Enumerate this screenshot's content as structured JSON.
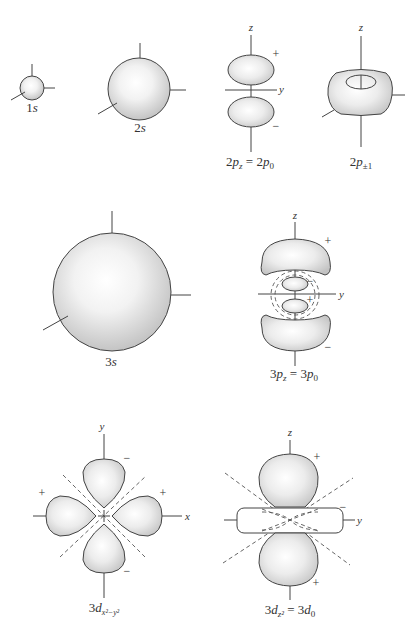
{
  "figure": {
    "colors": {
      "background": "#ffffff",
      "outline": "#444444",
      "fill_light": "#ffffff",
      "fill_dark": "#c8c8c8",
      "text": "#333333"
    },
    "orbitals": [
      {
        "id": "1s",
        "label_main": "1",
        "label_var": "s",
        "axes": []
      },
      {
        "id": "2s",
        "label_main": "2",
        "label_var": "s",
        "axes": []
      },
      {
        "id": "2pz",
        "label_prefix": "2",
        "label_var": "p",
        "label_sub": "z",
        "label_eq": " = 2",
        "label_var2": "p",
        "label_sub2": "0",
        "axes": [
          "z",
          "y"
        ],
        "signs": [
          "+",
          "−"
        ]
      },
      {
        "id": "2p±1",
        "label_prefix": "2",
        "label_var": "p",
        "label_sub": "±1",
        "axes": [
          "z"
        ]
      },
      {
        "id": "3s",
        "label_main": "3",
        "label_var": "s",
        "axes": []
      },
      {
        "id": "3pz",
        "label_prefix": "3",
        "label_var": "p",
        "label_sub": "z",
        "label_eq": " = 3",
        "label_var2": "p",
        "label_sub2": "0",
        "axes": [
          "z",
          "y"
        ],
        "signs": [
          "+",
          "−",
          "+",
          "−"
        ]
      },
      {
        "id": "3dx2-y2",
        "label_prefix": "3",
        "label_var": "d",
        "label_sub": "x²−y²",
        "axes": [
          "y",
          "x"
        ],
        "signs": [
          "−",
          "+",
          "+",
          "−"
        ]
      },
      {
        "id": "3dz2",
        "label_prefix": "3",
        "label_var": "d",
        "label_sub": "z²",
        "label_eq": " = 3",
        "label_var2": "d",
        "label_sub2": "0",
        "axes": [
          "z",
          "y"
        ],
        "signs": [
          "+",
          "−",
          "+"
        ]
      }
    ]
  }
}
